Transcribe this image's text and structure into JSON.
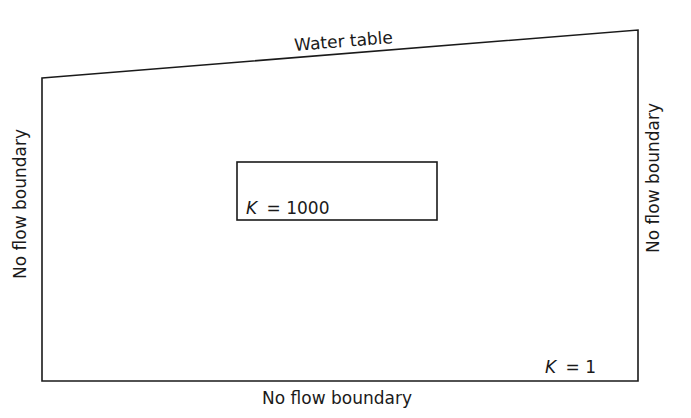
{
  "diagram": {
    "type": "groundwater flow domain",
    "domain_region": {
      "label": "K = 1",
      "k_symbol": "K",
      "k_value": "= 1",
      "top_boundary": "Water table",
      "left_boundary": "No flow boundary",
      "right_boundary": "No flow boundary",
      "bottom_boundary": "No flow boundary"
    },
    "inclusion": {
      "label": "K = 1000",
      "k_symbol": "K",
      "k_value": "= 1000"
    },
    "colors": {
      "line": "#1a1a1a",
      "background": "#ffffff"
    }
  }
}
